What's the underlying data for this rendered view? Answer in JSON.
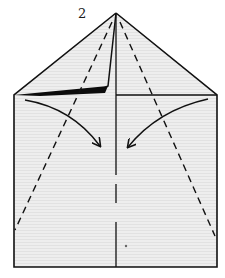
{
  "diagram": {
    "step_number": "2",
    "colors": {
      "paper": "#ececec",
      "line": "#111111",
      "background": "#ffffff"
    },
    "shape": {
      "apex": [
        116,
        13
      ],
      "left_shoulder": [
        14,
        95
      ],
      "right_shoulder": [
        217,
        95
      ],
      "bottom_left": [
        14,
        267
      ],
      "bottom_right": [
        217,
        267
      ]
    },
    "elements": [
      {
        "type": "outline",
        "description": "House-shaped paper outline (triangle nose on rectangle)"
      },
      {
        "type": "center-crease",
        "description": "Vertical center fold line"
      },
      {
        "type": "folded-flap",
        "description": "Left flap folded, shown with thick black edge"
      },
      {
        "type": "valley-fold-left",
        "description": "Dashed fold line from apex to lower left edge"
      },
      {
        "type": "valley-fold-right",
        "description": "Dashed fold line from apex to lower right edge"
      },
      {
        "type": "arrow-left",
        "description": "Curved arrow showing left side folding toward center"
      },
      {
        "type": "arrow-right",
        "description": "Curved arrow showing right side folding toward center"
      }
    ]
  }
}
